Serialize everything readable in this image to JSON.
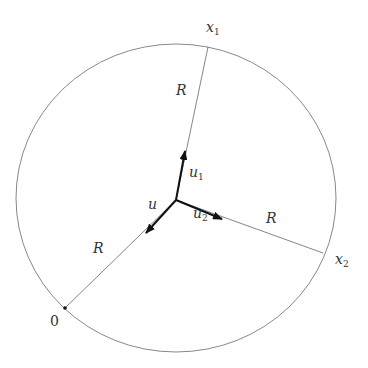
{
  "diagram": {
    "type": "geometry",
    "colors": {
      "circle": "#888888",
      "radius_line": "#777777",
      "arrow": "#111111",
      "text": "#333333"
    },
    "circle": {
      "cx": 176,
      "cy": 198,
      "rx": 160,
      "ry": 154
    },
    "center": {
      "x": 176,
      "y": 200
    },
    "points": [
      {
        "id": "x1",
        "base": "x",
        "sub": "1",
        "x": 208,
        "y": 47
      },
      {
        "id": "x2",
        "base": "x",
        "sub": "2",
        "x": 323,
        "y": 253
      },
      {
        "id": "zero",
        "label": "0",
        "x": 65,
        "y": 308
      }
    ],
    "radius_labels": [
      {
        "text": "R",
        "x": 177,
        "y": 84
      },
      {
        "text": "R",
        "x": 266,
        "y": 212
      },
      {
        "text": "R",
        "x": 94,
        "y": 242
      }
    ],
    "vectors": [
      {
        "id": "u",
        "base": "u",
        "sub": "",
        "tip_x": 146,
        "tip_y": 233,
        "label_x": 148,
        "label_y": 199
      },
      {
        "id": "u1",
        "base": "u",
        "sub": "1",
        "tip_x": 185,
        "tip_y": 151,
        "label_x": 188,
        "label_y": 166
      },
      {
        "id": "u2",
        "base": "u",
        "sub": "2",
        "tip_x": 222,
        "tip_y": 219,
        "label_x": 193,
        "label_y": 207
      }
    ],
    "labels": {
      "x1_base": "x",
      "x1_sub": "1",
      "x2_base": "x",
      "x2_sub": "2",
      "zero": "0",
      "R": "R",
      "u_base": "u",
      "u1_base": "u",
      "u1_sub": "1",
      "u2_base": "u",
      "u2_sub": "2"
    }
  }
}
